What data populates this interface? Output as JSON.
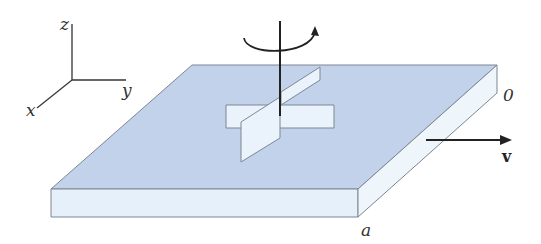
{
  "diagram": {
    "axes": {
      "x": "x",
      "y": "y",
      "z": "z"
    },
    "labels": {
      "corner_back": "0",
      "corner_front": "a",
      "velocity": "v"
    },
    "colors": {
      "top_face": "#c2d2ea",
      "side_face": "#e6f0fa",
      "vane": "#eaf3fb",
      "edge": "#7d8794",
      "line": "#222222"
    }
  }
}
